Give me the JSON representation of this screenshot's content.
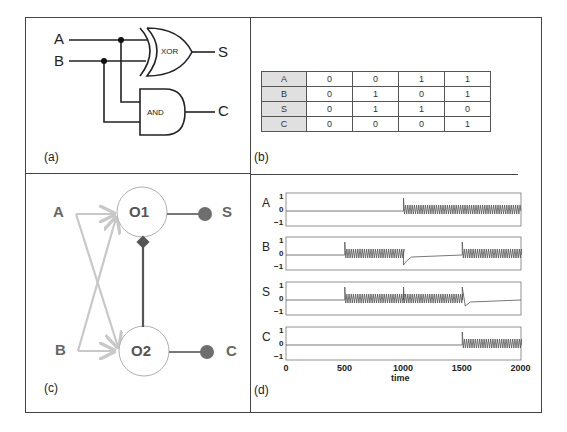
{
  "panels": {
    "a": {
      "label": "(a)",
      "inputs": [
        "A",
        "B"
      ],
      "gates": [
        {
          "name": "XOR",
          "output": "S"
        },
        {
          "name": "AND",
          "output": "C"
        }
      ]
    },
    "b": {
      "label": "(b)",
      "truth_table": {
        "rows": [
          {
            "name": "A",
            "values": [
              "0",
              "0",
              "1",
              "1"
            ]
          },
          {
            "name": "B",
            "values": [
              "0",
              "1",
              "0",
              "1"
            ]
          },
          {
            "name": "S",
            "values": [
              "0",
              "1",
              "1",
              "0"
            ]
          },
          {
            "name": "C",
            "values": [
              "0",
              "0",
              "0",
              "1"
            ]
          }
        ]
      }
    },
    "c": {
      "label": "(c)",
      "inputs": [
        "A",
        "B"
      ],
      "oscillators": [
        "O1",
        "O2"
      ],
      "outputs": [
        "S",
        "C"
      ]
    },
    "d": {
      "label": "(d)",
      "xlabel": "time",
      "xticks": [
        "0",
        "500",
        "1000",
        "1500",
        "2000"
      ],
      "yticks": [
        "1",
        "0",
        "−1"
      ],
      "signals": [
        "A",
        "B",
        "S",
        "C"
      ]
    }
  },
  "colors": {
    "line": "#222222",
    "light_arrow": "#c8c8c8",
    "node_fill": "#6e6e6e",
    "osc_circle": "#b0b0b0",
    "table_header": "#e0e0e0"
  },
  "chart_data": {
    "type": "line",
    "title": "",
    "xlabel": "time",
    "ylabel": "",
    "xlim": [
      0,
      2000
    ],
    "ylim": [
      -1,
      1
    ],
    "xticks": [
      0,
      500,
      1000,
      1500,
      2000
    ],
    "yticks": [
      -1,
      0,
      1
    ],
    "series": [
      {
        "name": "A",
        "description": "0 for t<1000; oscillating ~[-0.2,0.4] for t>=1000",
        "segments": [
          {
            "t": [
              0,
              1000
            ],
            "state": "off"
          },
          {
            "t": [
              1000,
              2000
            ],
            "state": "oscillating"
          }
        ]
      },
      {
        "name": "B",
        "description": "0 for t<500; oscillating 500-1000; transient dip at 1000 then 0; oscillating from 1500",
        "segments": [
          {
            "t": [
              0,
              500
            ],
            "state": "off"
          },
          {
            "t": [
              500,
              1000
            ],
            "state": "oscillating"
          },
          {
            "t": [
              1000,
              1500
            ],
            "state": "off"
          },
          {
            "t": [
              1500,
              2000
            ],
            "state": "oscillating"
          }
        ]
      },
      {
        "name": "S",
        "description": "oscillating 500-1500 with spikes at 500 and 1000; decays after 1500",
        "segments": [
          {
            "t": [
              0,
              500
            ],
            "state": "off"
          },
          {
            "t": [
              500,
              1000
            ],
            "state": "oscillating"
          },
          {
            "t": [
              1000,
              1500
            ],
            "state": "oscillating"
          },
          {
            "t": [
              1500,
              2000
            ],
            "state": "off"
          }
        ]
      },
      {
        "name": "C",
        "description": "transient spikes at 500 and 1000 decaying to 0; oscillating from 1500",
        "segments": [
          {
            "t": [
              0,
              1500
            ],
            "state": "off"
          },
          {
            "t": [
              1500,
              2000
            ],
            "state": "oscillating"
          }
        ]
      }
    ]
  }
}
